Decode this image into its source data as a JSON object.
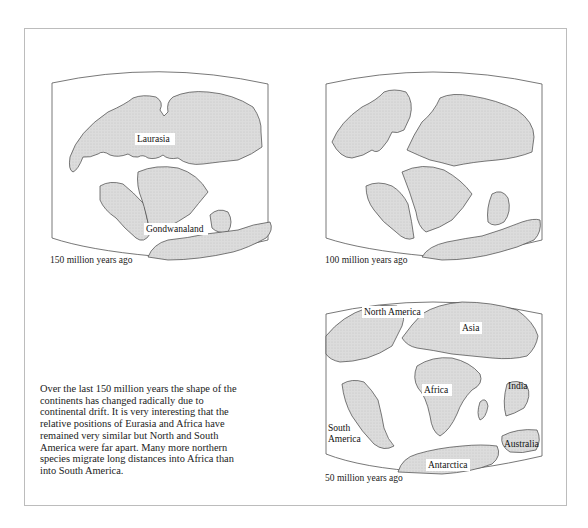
{
  "figure": {
    "maps": [
      {
        "caption": "150 million years ago",
        "labels": [
          {
            "text": "Laurasia"
          },
          {
            "text": "Gondwanaland"
          }
        ]
      },
      {
        "caption": "100 million years ago",
        "labels": []
      },
      {
        "caption": "50 million years ago",
        "labels": [
          {
            "text": "North America"
          },
          {
            "text": "Asia"
          },
          {
            "text": "Africa"
          },
          {
            "text": "India"
          },
          {
            "text": "South"
          },
          {
            "text": "America"
          },
          {
            "text": "Australia"
          },
          {
            "text": "Antarctica"
          }
        ]
      }
    ],
    "colors": {
      "land": "#d9d9d9",
      "coast": "#444444",
      "frame": "#555555",
      "page_border": "#bcbcbc"
    }
  },
  "description": {
    "lines": [
      "Over the last 150 million years the shape of the",
      "continents has changed radically due to",
      "continental drift. It is very interesting that the",
      "relative positions of Eurasia and Africa have",
      "remained very similar but North and South",
      "America were far apart. Many more northern",
      "species migrate long distances into Africa than",
      "into South America."
    ]
  }
}
